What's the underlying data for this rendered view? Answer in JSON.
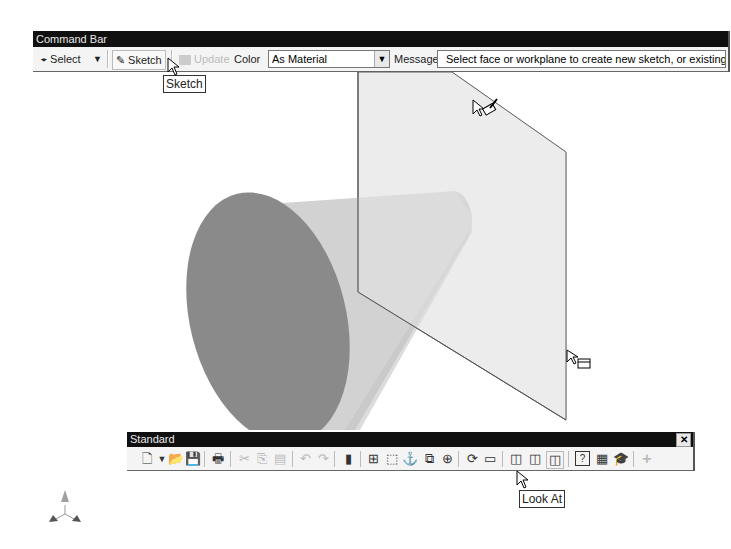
{
  "command_bar": {
    "title": "Command Bar",
    "select_label": "Select",
    "sketch_label": "Sketch",
    "update_label": "Update",
    "color_label": "Color",
    "color_value": "As Material",
    "message_label": "Message",
    "message_text": "Select face or workplane to create new sketch, or existing sketc"
  },
  "tooltips": {
    "sketch": "Sketch",
    "look_at": "Look At"
  },
  "standard_toolbar": {
    "title": "Standard",
    "close": "✕",
    "icons": [
      {
        "name": "new-icon",
        "glyph": "🗋"
      },
      {
        "name": "new-dropdown-icon",
        "glyph": "▾"
      },
      {
        "name": "open-icon",
        "glyph": "📂"
      },
      {
        "name": "save-icon",
        "glyph": "💾"
      },
      {
        "name": "print-icon",
        "glyph": "🖶"
      },
      {
        "name": "cut-icon",
        "glyph": "✂"
      },
      {
        "name": "copy-icon",
        "glyph": "⎘"
      },
      {
        "name": "paste-icon",
        "glyph": "📋"
      },
      {
        "name": "undo-icon",
        "glyph": "↶"
      },
      {
        "name": "redo-icon",
        "glyph": "↷"
      },
      {
        "name": "parts-icon",
        "glyph": "▮"
      },
      {
        "name": "zoom-all-icon",
        "glyph": "⊞"
      },
      {
        "name": "zoom-window-icon",
        "glyph": "⬚"
      },
      {
        "name": "pan-icon",
        "glyph": "⚓"
      },
      {
        "name": "zoom-selected-icon",
        "glyph": "⧉"
      },
      {
        "name": "zoom-icon",
        "glyph": "🔍"
      },
      {
        "name": "rotate-icon",
        "glyph": "⟳"
      },
      {
        "name": "look-at-icon",
        "glyph": "▭"
      },
      {
        "name": "shaded-display-icon",
        "glyph": "◫"
      },
      {
        "name": "hidden-edge-display-icon",
        "glyph": "◫"
      },
      {
        "name": "wireframe-display-icon",
        "glyph": "◫"
      },
      {
        "name": "help-icon",
        "glyph": "?"
      },
      {
        "name": "calculator-icon",
        "glyph": "▦"
      },
      {
        "name": "tutorial-icon",
        "glyph": "🎓"
      },
      {
        "name": "add-icon",
        "glyph": "+"
      }
    ]
  }
}
